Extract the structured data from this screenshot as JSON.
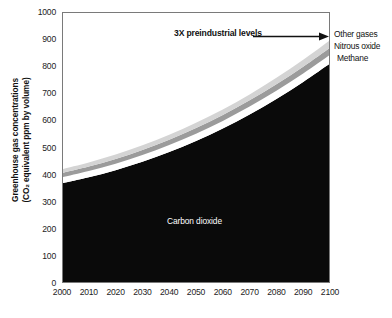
{
  "chart_data": {
    "type": "area",
    "title": "",
    "subtitle": "",
    "xlabel": "",
    "ylabel_line1": "Greenhouse gas concentrations",
    "ylabel_line2": "(CO₂ equivalent ppm by volume)",
    "stacked": true,
    "grid": false,
    "legend_position": "right-inline",
    "xlim": [
      2000,
      2100
    ],
    "ylim": [
      0,
      1000
    ],
    "x": [
      2000,
      2010,
      2020,
      2030,
      2040,
      2050,
      2060,
      2070,
      2080,
      2090,
      2100
    ],
    "xticks": [
      "2000",
      "2010",
      "2020",
      "2030",
      "2040",
      "2050",
      "2060",
      "2070",
      "2080",
      "2090",
      "2100"
    ],
    "yticks": [
      "0",
      "100",
      "200",
      "300",
      "400",
      "500",
      "600",
      "700",
      "800",
      "900",
      "1000"
    ],
    "series": [
      {
        "name": "Carbon dioxide",
        "color": "#0a0a0a",
        "label_inside": "Carbon dioxide",
        "values": [
          368,
          390,
          416,
          447,
          483,
          524,
          570,
          622,
          679,
          742,
          810
        ]
      },
      {
        "name": "Methane",
        "color": "#ffffff",
        "values": [
          22,
          23,
          24,
          25,
          26,
          27,
          28,
          29,
          30,
          31,
          32
        ]
      },
      {
        "name": "Nitrous oxide",
        "color": "#9b9b9b",
        "values": [
          16,
          17,
          18,
          19,
          20,
          21,
          22,
          23,
          24,
          25,
          26
        ]
      },
      {
        "name": "Other gases",
        "color": "#d4d4d4",
        "values": [
          14,
          15,
          16,
          17,
          18,
          19,
          20,
          22,
          24,
          26,
          28
        ]
      }
    ],
    "totals": [
      420,
      445,
      474,
      508,
      547,
      591,
      640,
      696,
      757,
      824,
      896
    ],
    "annotations": [
      {
        "name": "3x-preindustrial",
        "text": "3X preindustrial levels",
        "bold": true,
        "arrow": true,
        "points_to_x": 2100,
        "points_to_y": 896
      }
    ],
    "legend": [
      {
        "label": "Other gases",
        "color": "#d4d4d4"
      },
      {
        "label": "Nitrous oxide",
        "color": "#9b9b9b"
      },
      {
        "label": "Methane",
        "color": "#ffffff"
      }
    ]
  },
  "axis": {
    "ylabel_line1": "Greenhouse gas concentrations",
    "ylabel_line2": "(CO₂ equivalent ppm by volume)"
  },
  "labels": {
    "annot_3x": "3X preindustrial levels",
    "other_gases": "Other gases",
    "nitrous_oxide": "Nitrous oxide",
    "methane": "Methane",
    "carbon_dioxide": "Carbon dioxide"
  }
}
